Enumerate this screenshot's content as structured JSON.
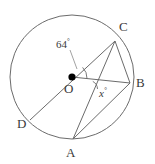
{
  "figure": {
    "type": "circle-geometry-diagram",
    "stroke_color": "#6b6b6b",
    "text_color": "#3a3a3a",
    "background_color": "#ffffff",
    "center_dot_color": "#000000",
    "circle": {
      "center_label": "O",
      "cx": 72,
      "cy": 77,
      "r": 62
    },
    "points": [
      {
        "label": "A",
        "x": 73,
        "y": 139,
        "label_x": 67,
        "label_y": 147
      },
      {
        "label": "B",
        "x": 130,
        "y": 83,
        "label_x": 135,
        "label_y": 77
      },
      {
        "label": "C",
        "x": 115,
        "y": 41,
        "label_x": 119,
        "label_y": 26
      },
      {
        "label": "D",
        "x": 30,
        "y": 120,
        "label_x": 18,
        "label_y": 123
      }
    ],
    "center_point": {
      "label": "O",
      "x": 72,
      "y": 77,
      "label_x": 66,
      "label_y": 82
    },
    "segments": [
      {
        "name": "segment-D-C",
        "x1": 30,
        "y1": 120,
        "x2": 115,
        "y2": 41
      },
      {
        "name": "segment-O-B",
        "x1": 72,
        "y1": 77,
        "x2": 130,
        "y2": 83
      },
      {
        "name": "segment-C-A",
        "x1": 115,
        "y1": 41,
        "x2": 73,
        "y2": 139
      },
      {
        "name": "segment-C-B",
        "x1": 115,
        "y1": 41,
        "x2": 130,
        "y2": 83
      },
      {
        "name": "segment-A-B",
        "x1": 73,
        "y1": 139,
        "x2": 130,
        "y2": 83
      }
    ],
    "angles": [
      {
        "name": "central-angle-COB",
        "value": "64",
        "unit": "°",
        "label_x": 56,
        "label_y": 38,
        "vertex_x": 72,
        "vertex_y": 77,
        "arc_radius": 15,
        "leader": {
          "x1": 70,
          "y1": 50,
          "x2": 76,
          "y2": 70
        },
        "italic": false
      },
      {
        "name": "angle-x",
        "value": "x",
        "unit": "°",
        "label_x": 99,
        "label_y": 86,
        "vertex_x": 97,
        "vertex_y": 80,
        "arc_radius": 9,
        "italic": true
      }
    ]
  }
}
